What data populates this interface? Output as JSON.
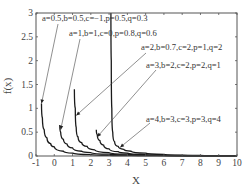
{
  "chart_data": {
    "type": "line",
    "title": "",
    "xlabel": "X",
    "ylabel": "f(x)",
    "xlim": [
      -1,
      10
    ],
    "ylim": [
      0,
      3
    ],
    "grid": false,
    "legend": "none (inline annotations with arrows)",
    "xticks": [
      "-1",
      "0",
      "1",
      "2",
      "3",
      "4",
      "5",
      "6",
      "7",
      "8",
      "9",
      "10"
    ],
    "yticks": [
      "0",
      "0.5",
      "1",
      "1.5",
      "2",
      "2.5",
      "3"
    ],
    "series": [
      {
        "name": "a=0.5,b=0.5,c=-1,p=0.5,q=0.3",
        "start": [
          -0.7,
          1.1
        ],
        "points": [
          [
            -0.7,
            1.1
          ],
          [
            -0.65,
            0.8
          ],
          [
            -0.55,
            0.55
          ],
          [
            -0.4,
            0.38
          ],
          [
            -0.2,
            0.26
          ],
          [
            0,
            0.19
          ],
          [
            0.5,
            0.1
          ],
          [
            1,
            0.06
          ],
          [
            2,
            0.03
          ],
          [
            3,
            0.015
          ],
          [
            5,
            0.006
          ],
          [
            10,
            0.001
          ]
        ],
        "annotation_arrow_to": [
          -0.7,
          1.1
        ]
      },
      {
        "name": "a=1,b=1,c=0,p=0.8,q=0.6",
        "start": [
          0.3,
          0.65
        ],
        "points": [
          [
            0.3,
            0.65
          ],
          [
            0.35,
            0.5
          ],
          [
            0.5,
            0.35
          ],
          [
            0.7,
            0.25
          ],
          [
            1,
            0.17
          ],
          [
            1.5,
            0.1
          ],
          [
            2,
            0.07
          ],
          [
            3,
            0.04
          ],
          [
            4,
            0.02
          ],
          [
            6,
            0.008
          ],
          [
            10,
            0.002
          ]
        ],
        "annotation_arrow_to": [
          0.35,
          0.55
        ]
      },
      {
        "name": "a=2,b=0.7,c=2,p=1,q=2",
        "start": [
          1.1,
          1.4
        ],
        "points": [
          [
            1.1,
            1.4
          ],
          [
            1.15,
            1.0
          ],
          [
            1.2,
            0.6
          ],
          [
            1.3,
            0.4
          ],
          [
            1.5,
            0.28
          ],
          [
            1.8,
            0.2
          ],
          [
            2.2,
            0.13
          ],
          [
            3,
            0.07
          ],
          [
            4,
            0.04
          ],
          [
            6,
            0.015
          ],
          [
            10,
            0.003
          ]
        ],
        "annotation_arrow_to": [
          1.2,
          0.85
        ]
      },
      {
        "name": "a=3,b=2,c=2,p=2,q=1",
        "start": [
          2.3,
          0.55
        ],
        "points": [
          [
            2.3,
            0.55
          ],
          [
            2.35,
            0.45
          ],
          [
            2.5,
            0.32
          ],
          [
            2.7,
            0.23
          ],
          [
            3,
            0.15
          ],
          [
            3.5,
            0.09
          ],
          [
            4,
            0.06
          ],
          [
            5,
            0.03
          ],
          [
            7,
            0.01
          ],
          [
            10,
            0.003
          ]
        ],
        "annotation_arrow_to": [
          2.35,
          0.4
        ]
      },
      {
        "name": "a=4,b=3,c=3,p=3,q=4",
        "start": [
          3.1,
          3.0
        ],
        "points": [
          [
            3.1,
            3.0
          ],
          [
            3.12,
            2.0
          ],
          [
            3.15,
            1.0
          ],
          [
            3.2,
            0.5
          ],
          [
            3.3,
            0.3
          ],
          [
            3.5,
            0.2
          ],
          [
            3.8,
            0.14
          ],
          [
            4.2,
            0.1
          ],
          [
            5,
            0.06
          ],
          [
            6,
            0.035
          ],
          [
            8,
            0.015
          ],
          [
            10,
            0.007
          ]
        ],
        "annotation_arrow_to": [
          3.6,
          0.18
        ]
      }
    ]
  },
  "annotations": [
    {
      "text": "a=0.5,b=0.5,c=−1,p=0.5,q=0.3",
      "x": 42,
      "y": 21
    },
    {
      "text": "a=1,b=1,c=0,p=0.8,q=0.6",
      "x": 69,
      "y": 36
    },
    {
      "text": "a=2,b=0.7,c=2,p=1,q=2",
      "x": 141,
      "y": 50
    },
    {
      "text": "a=3,b=2,c=2,p=2,q=1",
      "x": 146,
      "y": 68
    },
    {
      "text": "a=4,b=3,c=3,p=3,q=4",
      "x": 146,
      "y": 122
    }
  ]
}
